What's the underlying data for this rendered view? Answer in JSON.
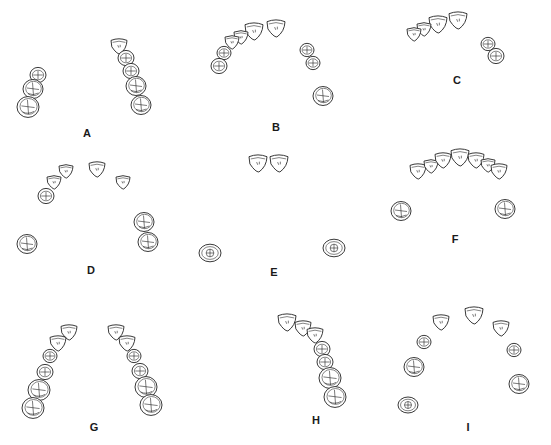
{
  "figure": {
    "background": "#ffffff",
    "ink_color": "#222222",
    "panels": [
      {
        "id": "A",
        "label": "A",
        "label_pos": [
          87,
          133
        ],
        "teeth": [
          {
            "x": 38,
            "y": 75,
            "r": 8,
            "type": "premolar"
          },
          {
            "x": 33,
            "y": 89,
            "r": 10,
            "type": "molar"
          },
          {
            "x": 28,
            "y": 107,
            "r": 11,
            "type": "molar"
          },
          {
            "x": 119,
            "y": 46,
            "r": 8,
            "type": "incisor"
          },
          {
            "x": 126,
            "y": 58,
            "r": 8,
            "type": "premolar"
          },
          {
            "x": 131,
            "y": 71,
            "r": 8,
            "type": "premolar"
          },
          {
            "x": 136,
            "y": 86,
            "r": 10,
            "type": "molar"
          },
          {
            "x": 141,
            "y": 105,
            "r": 10,
            "type": "molar"
          }
        ]
      },
      {
        "id": "B",
        "label": "B",
        "label_pos": [
          276,
          127
        ],
        "teeth": [
          {
            "x": 276,
            "y": 28,
            "r": 9,
            "type": "incisor"
          },
          {
            "x": 254,
            "y": 31,
            "r": 9,
            "type": "incisor"
          },
          {
            "x": 241,
            "y": 37,
            "r": 7,
            "type": "incisor"
          },
          {
            "x": 232,
            "y": 42,
            "r": 7,
            "type": "canine"
          },
          {
            "x": 224,
            "y": 53,
            "r": 7,
            "type": "premolar"
          },
          {
            "x": 219,
            "y": 66,
            "r": 8,
            "type": "premolar"
          },
          {
            "x": 307,
            "y": 50,
            "r": 7,
            "type": "premolar"
          },
          {
            "x": 313,
            "y": 63,
            "r": 7,
            "type": "premolar"
          },
          {
            "x": 323,
            "y": 96,
            "r": 10,
            "type": "molar"
          }
        ]
      },
      {
        "id": "C",
        "label": "C",
        "label_pos": [
          457,
          80
        ],
        "teeth": [
          {
            "x": 458,
            "y": 20,
            "r": 9,
            "type": "incisor"
          },
          {
            "x": 438,
            "y": 24,
            "r": 9,
            "type": "incisor"
          },
          {
            "x": 424,
            "y": 29,
            "r": 7,
            "type": "incisor"
          },
          {
            "x": 414,
            "y": 34,
            "r": 7,
            "type": "canine"
          },
          {
            "x": 488,
            "y": 44,
            "r": 7,
            "type": "premolar"
          },
          {
            "x": 496,
            "y": 56,
            "r": 8,
            "type": "premolar"
          }
        ]
      },
      {
        "id": "D",
        "label": "D",
        "label_pos": [
          91,
          270
        ],
        "teeth": [
          {
            "x": 66,
            "y": 171,
            "r": 7,
            "type": "incisor"
          },
          {
            "x": 54,
            "y": 182,
            "r": 7,
            "type": "canine"
          },
          {
            "x": 46,
            "y": 196,
            "r": 8,
            "type": "premolar"
          },
          {
            "x": 97,
            "y": 169,
            "r": 8,
            "type": "incisor"
          },
          {
            "x": 123,
            "y": 182,
            "r": 7,
            "type": "incisor"
          },
          {
            "x": 144,
            "y": 222,
            "r": 10,
            "type": "molar"
          },
          {
            "x": 148,
            "y": 242,
            "r": 10,
            "type": "molar"
          },
          {
            "x": 27,
            "y": 244,
            "r": 10,
            "type": "molar"
          }
        ]
      },
      {
        "id": "E",
        "label": "E",
        "label_pos": [
          274,
          272
        ],
        "teeth": [
          {
            "x": 258,
            "y": 163,
            "r": 9,
            "type": "incisor"
          },
          {
            "x": 279,
            "y": 163,
            "r": 9,
            "type": "incisor"
          },
          {
            "x": 210,
            "y": 253,
            "r": 11,
            "type": "molar_oval"
          },
          {
            "x": 334,
            "y": 248,
            "r": 11,
            "type": "molar_oval"
          }
        ]
      },
      {
        "id": "F",
        "label": "F",
        "label_pos": [
          455,
          239
        ],
        "teeth": [
          {
            "x": 418,
            "y": 171,
            "r": 8,
            "type": "canine"
          },
          {
            "x": 431,
            "y": 166,
            "r": 7,
            "type": "incisor"
          },
          {
            "x": 443,
            "y": 160,
            "r": 8,
            "type": "incisor"
          },
          {
            "x": 460,
            "y": 157,
            "r": 9,
            "type": "incisor"
          },
          {
            "x": 476,
            "y": 160,
            "r": 8,
            "type": "incisor"
          },
          {
            "x": 488,
            "y": 165,
            "r": 7,
            "type": "incisor"
          },
          {
            "x": 499,
            "y": 171,
            "r": 8,
            "type": "canine"
          },
          {
            "x": 401,
            "y": 211,
            "r": 10,
            "type": "molar"
          },
          {
            "x": 505,
            "y": 209,
            "r": 10,
            "type": "molar"
          }
        ]
      },
      {
        "id": "G",
        "label": "G",
        "label_pos": [
          94,
          427
        ],
        "teeth": [
          {
            "x": 69,
            "y": 332,
            "r": 8,
            "type": "incisor"
          },
          {
            "x": 58,
            "y": 343,
            "r": 8,
            "type": "incisor"
          },
          {
            "x": 50,
            "y": 356,
            "r": 7,
            "type": "premolar"
          },
          {
            "x": 45,
            "y": 372,
            "r": 8,
            "type": "premolar"
          },
          {
            "x": 39,
            "y": 390,
            "r": 11,
            "type": "molar"
          },
          {
            "x": 33,
            "y": 408,
            "r": 11,
            "type": "molar"
          },
          {
            "x": 116,
            "y": 332,
            "r": 8,
            "type": "incisor"
          },
          {
            "x": 127,
            "y": 343,
            "r": 8,
            "type": "incisor"
          },
          {
            "x": 134,
            "y": 356,
            "r": 7,
            "type": "premolar"
          },
          {
            "x": 140,
            "y": 371,
            "r": 8,
            "type": "premolar"
          },
          {
            "x": 146,
            "y": 387,
            "r": 11,
            "type": "molar"
          },
          {
            "x": 151,
            "y": 405,
            "r": 11,
            "type": "molar"
          }
        ]
      },
      {
        "id": "H",
        "label": "H",
        "label_pos": [
          316,
          420
        ],
        "teeth": [
          {
            "x": 287,
            "y": 322,
            "r": 9,
            "type": "incisor"
          },
          {
            "x": 303,
            "y": 328,
            "r": 8,
            "type": "incisor"
          },
          {
            "x": 315,
            "y": 335,
            "r": 8,
            "type": "canine"
          },
          {
            "x": 322,
            "y": 349,
            "r": 8,
            "type": "premolar"
          },
          {
            "x": 325,
            "y": 362,
            "r": 8,
            "type": "premolar"
          },
          {
            "x": 330,
            "y": 378,
            "r": 11,
            "type": "molar"
          },
          {
            "x": 335,
            "y": 397,
            "r": 11,
            "type": "molar"
          }
        ]
      },
      {
        "id": "I",
        "label": "I",
        "label_pos": [
          468,
          427
        ],
        "teeth": [
          {
            "x": 441,
            "y": 322,
            "r": 8,
            "type": "incisor"
          },
          {
            "x": 474,
            "y": 315,
            "r": 9,
            "type": "incisor"
          },
          {
            "x": 501,
            "y": 328,
            "r": 8,
            "type": "incisor"
          },
          {
            "x": 424,
            "y": 342,
            "r": 7,
            "type": "premolar"
          },
          {
            "x": 514,
            "y": 350,
            "r": 7,
            "type": "premolar"
          },
          {
            "x": 414,
            "y": 367,
            "r": 10,
            "type": "molar"
          },
          {
            "x": 519,
            "y": 384,
            "r": 10,
            "type": "molar"
          },
          {
            "x": 408,
            "y": 405,
            "r": 10,
            "type": "molar_oval"
          }
        ]
      }
    ]
  }
}
